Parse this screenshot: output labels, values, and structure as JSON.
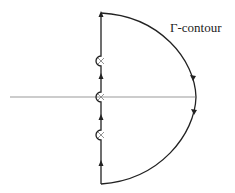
{
  "diagram": {
    "label": "Γ-contour",
    "colors": {
      "contour": "#222222",
      "axis": "#9a9a9a",
      "pole": "#888888"
    },
    "poles": [
      "pole-upper",
      "pole-origin",
      "pole-lower"
    ]
  }
}
